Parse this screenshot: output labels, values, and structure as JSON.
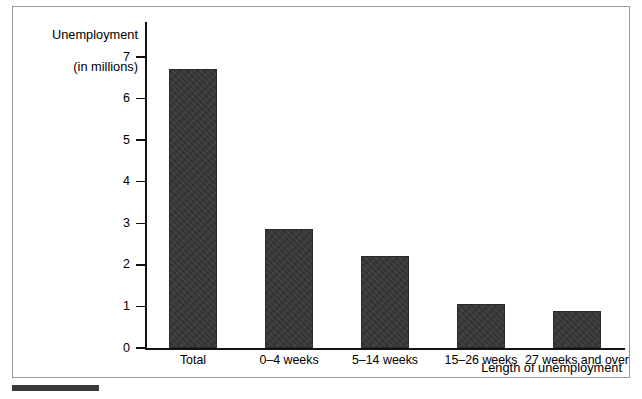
{
  "chart_data": {
    "type": "bar",
    "title": "",
    "categories": [
      "Total",
      "0–4 weeks",
      "5–14 weeks",
      "15–26 weeks",
      "27 weeks and over"
    ],
    "values": [
      6.7,
      2.86,
      2.22,
      1.05,
      0.88
    ],
    "xlabel": "Length of unemployment",
    "ylabel": "Unemployment\n(in millions)",
    "ylabel_line1": "Unemployment",
    "ylabel_line2": "(in millions)",
    "ylim": [
      0,
      7
    ],
    "ytick_labels": [
      "0",
      "1",
      "2",
      "3",
      "4",
      "5",
      "6",
      "7"
    ],
    "ytick_values": [
      0,
      1,
      2,
      3,
      4,
      5,
      6,
      7
    ],
    "grid": false,
    "legend": false,
    "bar_color": "#363636",
    "axis_color": "#111111",
    "frame_color": "#9a9a9a"
  }
}
